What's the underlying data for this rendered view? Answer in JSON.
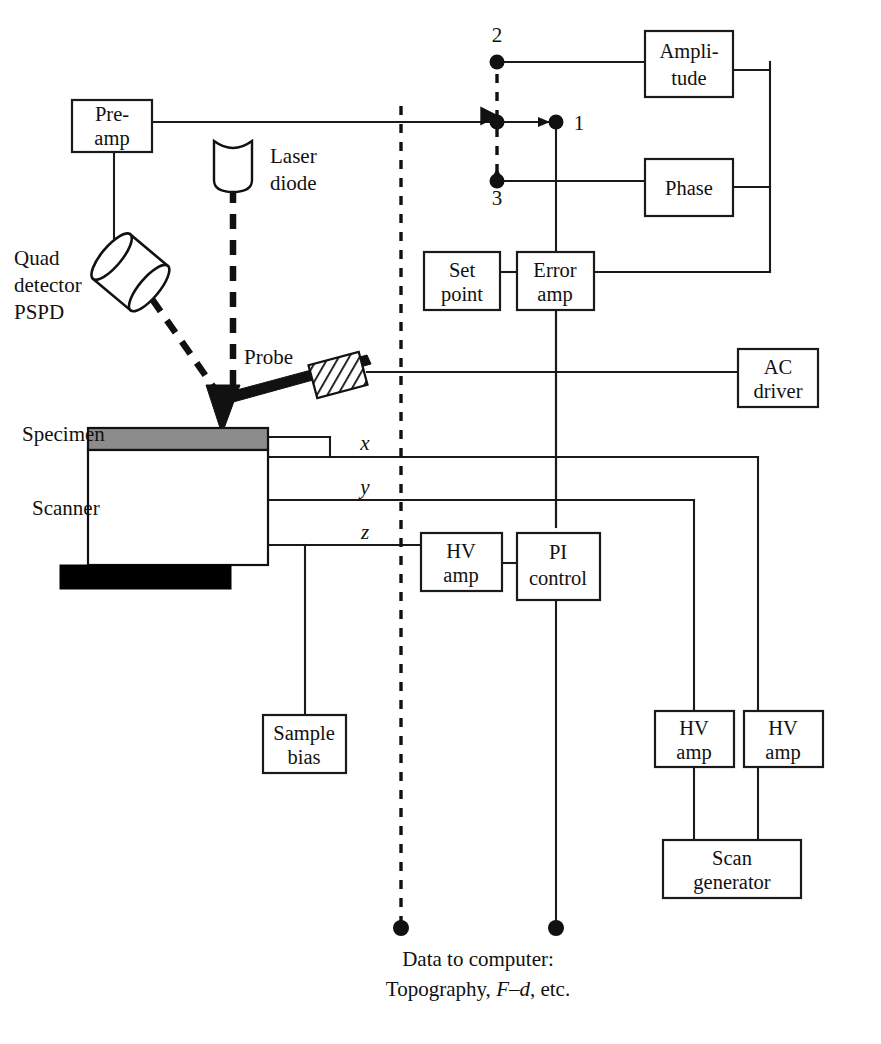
{
  "figure": {
    "background": "#ffffff",
    "line_color": "#1a1a1a",
    "specimen_fill": "#8c8c8c",
    "base_fill": "#000000"
  },
  "blocks": {
    "preamp": {
      "line1": "Pre-",
      "line2": "amp"
    },
    "amplitude": {
      "line1": "Ampli-",
      "line2": "tude"
    },
    "phase": {
      "line1": "Phase",
      "line2": ""
    },
    "setpoint": {
      "line1": "Set",
      "line2": "point"
    },
    "erroramp": {
      "line1": "Error",
      "line2": "amp"
    },
    "acdriver": {
      "line1": "AC",
      "line2": "driver"
    },
    "hvamp_z": {
      "line1": "HV",
      "line2": "amp"
    },
    "picontrol": {
      "line1": "PI",
      "line2": "control"
    },
    "samplebias": {
      "line1": "Sample",
      "line2": "bias"
    },
    "hvamp_y": {
      "line1": "HV",
      "line2": "amp"
    },
    "hvamp_x": {
      "line1": "HV",
      "line2": "amp"
    },
    "scangenerator": {
      "line1": "Scan",
      "line2": "generator"
    }
  },
  "labels": {
    "laser_diode_line1": "Laser",
    "laser_diode_line2": "diode",
    "quad_line1": "Quad",
    "quad_line2": "detector",
    "quad_line3": "PSPD",
    "probe": "Probe",
    "specimen": "Specimen",
    "scanner": "Scanner"
  },
  "axes": {
    "x": "x",
    "y": "y",
    "z": "z"
  },
  "switch_nodes": {
    "node1": "1",
    "node2": "2",
    "node3": "3"
  },
  "caption": {
    "line1": "Data to computer:",
    "line2_pre": "Topography, ",
    "line2_ital": "F–d",
    "line2_post": ", etc."
  }
}
